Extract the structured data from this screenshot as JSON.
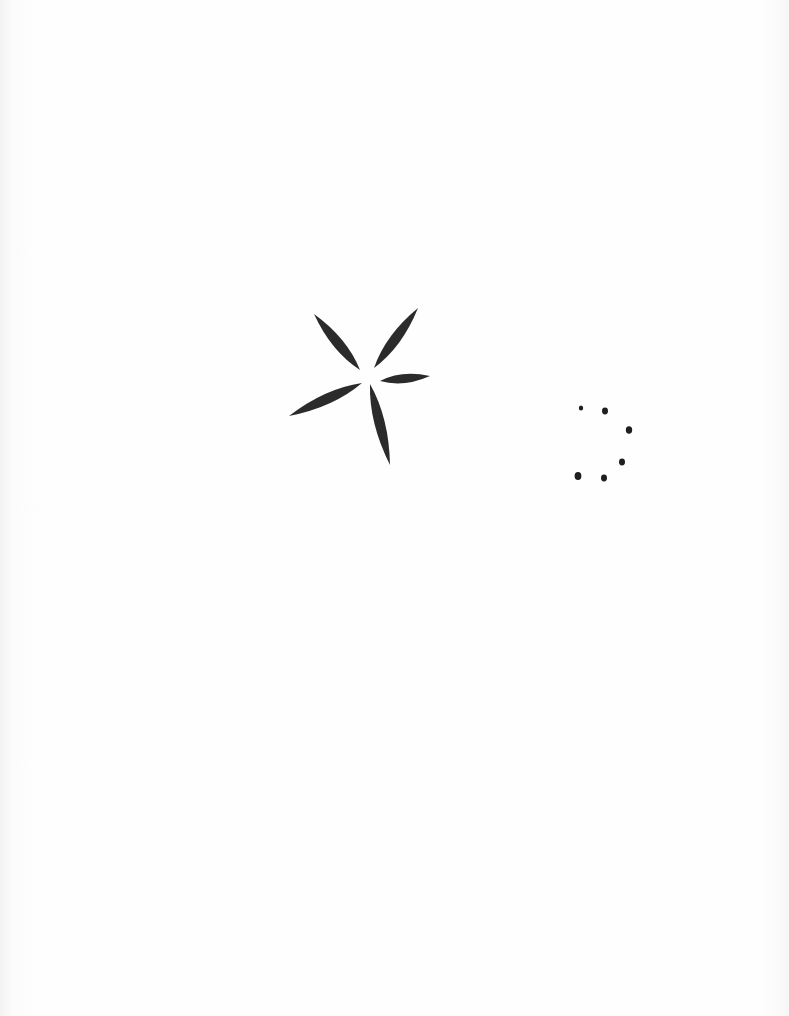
{
  "page": {
    "background": "#fdfdfd",
    "ink_color": "#2a2a2a"
  },
  "drawings": [
    {
      "name": "five-petal-star",
      "center": [
        372,
        377
      ],
      "petals": [
        {
          "from": [
            360,
            370
          ],
          "to": [
            314,
            314
          ]
        },
        {
          "from": [
            374,
            368
          ],
          "to": [
            418,
            308
          ]
        },
        {
          "from": [
            380,
            381
          ],
          "to": [
            430,
            376
          ]
        },
        {
          "from": [
            362,
            383
          ],
          "to": [
            289,
            416
          ]
        },
        {
          "from": [
            370,
            384
          ],
          "to": [
            390,
            465
          ]
        }
      ]
    },
    {
      "name": "dot-ring",
      "dots": [
        {
          "cx": 581,
          "cy": 408,
          "r": 2.2
        },
        {
          "cx": 605,
          "cy": 411,
          "r": 3.0
        },
        {
          "cx": 629,
          "cy": 430,
          "r": 3.2
        },
        {
          "cx": 622,
          "cy": 462,
          "r": 3.0
        },
        {
          "cx": 604,
          "cy": 478,
          "r": 3.0
        },
        {
          "cx": 578,
          "cy": 476,
          "r": 3.4
        }
      ]
    }
  ]
}
